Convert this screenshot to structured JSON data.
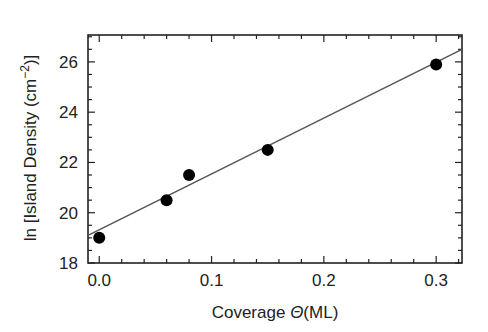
{
  "chart_data": {
    "type": "scatter",
    "title": "",
    "xlabel": "Coverage Θ(ML)",
    "ylabel": "ln [Island Density (cm⁻²)]",
    "ylabel_parts": {
      "prefix": "ln [Island Density (cm",
      "superscript": "−2",
      "suffix": ")]"
    },
    "xlabel_parts": {
      "prefix": "Coverage ",
      "symbol": "Θ",
      "suffix": "(ML)"
    },
    "xlim": [
      -0.01,
      0.323
    ],
    "ylim": [
      18,
      27.07
    ],
    "x_ticks": [
      0.0,
      0.1,
      0.2,
      0.3
    ],
    "x_tick_labels": [
      "0.0",
      "0.1",
      "0.2",
      "0.3"
    ],
    "x_minor_step": 0.02,
    "y_ticks": [
      18,
      20,
      22,
      24,
      26
    ],
    "y_tick_labels": [
      "18",
      "20",
      "22",
      "24",
      "26"
    ],
    "y_minor_step": 0.5,
    "grid": false,
    "legend": null,
    "series": [
      {
        "name": "data",
        "kind": "scatter",
        "marker": "filled-circle",
        "color": "#000000",
        "points": [
          {
            "x": 0.0,
            "y": 19.0
          },
          {
            "x": 0.06,
            "y": 20.5
          },
          {
            "x": 0.08,
            "y": 21.5
          },
          {
            "x": 0.15,
            "y": 22.5
          },
          {
            "x": 0.3,
            "y": 25.9
          }
        ]
      },
      {
        "name": "linear fit",
        "kind": "line",
        "color": "#555555",
        "points": [
          {
            "x": -0.01,
            "y": 19.1
          },
          {
            "x": 0.323,
            "y": 26.5
          }
        ]
      }
    ]
  }
}
